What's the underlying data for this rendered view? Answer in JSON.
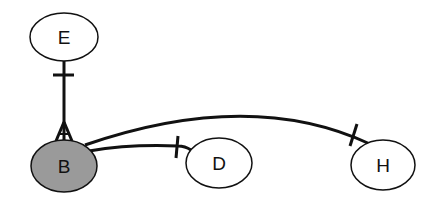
{
  "diagram": {
    "type": "entity-relationship",
    "nodes": [
      {
        "id": "E",
        "label": "E",
        "cx": 64,
        "cy": 37,
        "rx": 34,
        "ry": 24,
        "fill": "#ffffff"
      },
      {
        "id": "B",
        "label": "B",
        "cx": 64,
        "cy": 166,
        "rx": 33,
        "ry": 26,
        "fill": "#9a9a9a"
      },
      {
        "id": "D",
        "label": "D",
        "cx": 219,
        "cy": 163,
        "rx": 33,
        "ry": 25,
        "fill": "#ffffff"
      },
      {
        "id": "H",
        "label": "H",
        "cx": 383,
        "cy": 165,
        "rx": 32,
        "ry": 25,
        "fill": "#ffffff"
      }
    ],
    "edges": [
      {
        "from": "E",
        "to": "B",
        "from_end": "one",
        "to_end": "many"
      },
      {
        "from": "B",
        "to": "D",
        "from_end": "none",
        "to_end": "one"
      },
      {
        "from": "B",
        "to": "H",
        "from_end": "none",
        "to_end": "one"
      }
    ],
    "colors": {
      "stroke": "#111111",
      "highlight_fill": "#9a9a9a",
      "default_fill": "#ffffff"
    }
  }
}
